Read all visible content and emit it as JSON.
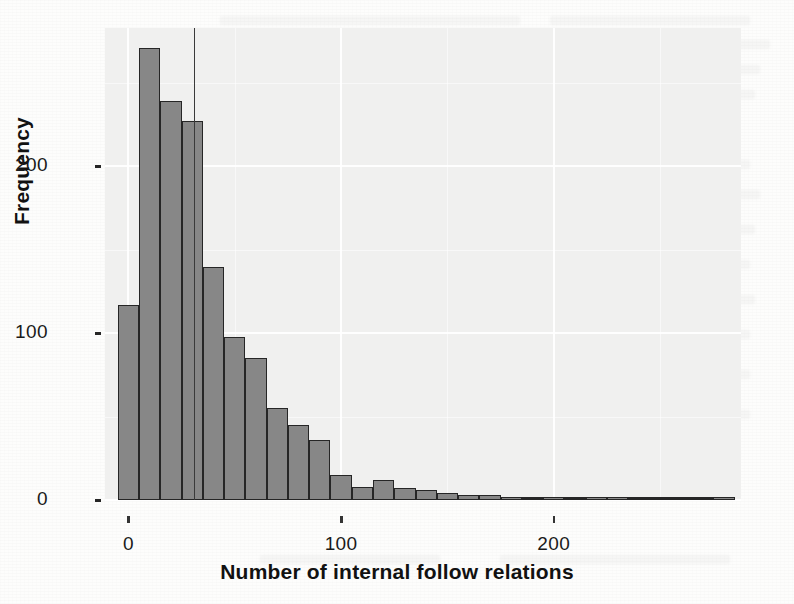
{
  "figure": {
    "kind": "histogram-figure",
    "background_color": "#fdfdfc",
    "panel_color": "#f0f0ef",
    "bar_fill": "#878787",
    "bar_stroke": "#262626",
    "vline_color": "#3a3a3a"
  },
  "chart_data": {
    "type": "bar",
    "subtype": "histogram",
    "title": "",
    "xlabel": "Number of internal follow relations",
    "ylabel": "Frequency",
    "xlim": [
      -11,
      288
    ],
    "ylim": [
      0,
      283
    ],
    "grid": true,
    "legend": null,
    "bin_width": 10,
    "xticks": [
      0,
      100,
      200
    ],
    "xtick_labels": [
      "0",
      "100",
      "200"
    ],
    "yticks": [
      0,
      100,
      200
    ],
    "ytick_labels": [
      "0",
      "100",
      "200"
    ],
    "annotations": [
      {
        "kind": "vertical-reference-line",
        "x": 31,
        "label": ""
      }
    ],
    "bin_centers": [
      0,
      10,
      20,
      30,
      40,
      50,
      60,
      70,
      80,
      90,
      100,
      110,
      120,
      130,
      140,
      150,
      160,
      170,
      180,
      190,
      200,
      210,
      220,
      230,
      240,
      250,
      260,
      270,
      280
    ],
    "values": [
      117,
      271,
      239,
      227,
      140,
      98,
      85,
      55,
      45,
      36,
      15,
      8,
      12,
      7,
      6,
      4,
      3,
      3,
      1,
      0,
      2,
      0,
      1,
      1,
      0,
      0,
      0,
      0,
      2
    ]
  },
  "axes": {
    "y_title": "Frequency",
    "x_title": "Number of internal follow relations"
  }
}
